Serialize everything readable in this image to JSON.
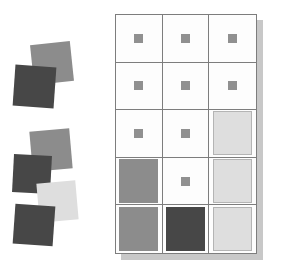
{
  "scene": {
    "title": "Square swatch sorting layout",
    "width": 283,
    "height": 275,
    "background_color": "#ffffff"
  },
  "palette": {
    "dark_gray": "#474747",
    "medium_gray": "#8c8c8c",
    "small_swatch_gray": "#909090",
    "light_gray": "#dedede",
    "swatch_outline": "#b4b4b4",
    "grid_line": "#7d7d7d",
    "panel_background": "#fdfdfd",
    "panel_shadow": "#c8c8c8"
  },
  "clusters": [
    {
      "name": "upper-cluster",
      "label": "Upper loose swatch pile",
      "left": 10,
      "top": 12,
      "width": 95,
      "height": 110,
      "squares": [
        {
          "id": "u1",
          "tone": "medium",
          "color": "#8c8c8c",
          "left": 22,
          "top": 31,
          "size": 40,
          "rotation": -6
        },
        {
          "id": "u2",
          "tone": "dark",
          "color": "#474747",
          "left": 4,
          "top": 54,
          "size": 41,
          "rotation": 4
        }
      ]
    },
    {
      "name": "lower-cluster",
      "label": "Lower loose swatch pile",
      "left": 5,
      "top": 128,
      "width": 100,
      "height": 125,
      "squares": [
        {
          "id": "l1",
          "tone": "medium",
          "color": "#8c8c8c",
          "left": 26,
          "top": 2,
          "size": 40,
          "rotation": -5
        },
        {
          "id": "l2",
          "tone": "dark",
          "color": "#474747",
          "left": 8,
          "top": 27,
          "size": 38,
          "rotation": 3
        },
        {
          "id": "l3",
          "tone": "light",
          "color": "#dedede",
          "left": 33,
          "top": 54,
          "size": 39,
          "rotation": -5
        },
        {
          "id": "l4",
          "tone": "dark",
          "color": "#474747",
          "left": 9,
          "top": 77,
          "size": 40,
          "rotation": 4
        }
      ]
    }
  ],
  "matrix": {
    "name": "swatch-grid",
    "label": "Three column by five row swatch grid",
    "left": 115,
    "top": 14,
    "width": 142,
    "height": 240,
    "shadow_offset_x": 6,
    "shadow_offset_y": 6,
    "columns": 3,
    "rows": 5,
    "cells": [
      {
        "row": 1,
        "col": 1,
        "size": "small",
        "tone": "medium",
        "color": "#909090",
        "outlined": false
      },
      {
        "row": 1,
        "col": 2,
        "size": "small",
        "tone": "medium",
        "color": "#909090",
        "outlined": false
      },
      {
        "row": 1,
        "col": 3,
        "size": "small",
        "tone": "medium",
        "color": "#909090",
        "outlined": false
      },
      {
        "row": 2,
        "col": 1,
        "size": "small",
        "tone": "medium",
        "color": "#909090",
        "outlined": false
      },
      {
        "row": 2,
        "col": 2,
        "size": "small",
        "tone": "medium",
        "color": "#909090",
        "outlined": false
      },
      {
        "row": 2,
        "col": 3,
        "size": "small",
        "tone": "medium",
        "color": "#909090",
        "outlined": false
      },
      {
        "row": 3,
        "col": 1,
        "size": "small",
        "tone": "medium",
        "color": "#909090",
        "outlined": false
      },
      {
        "row": 3,
        "col": 2,
        "size": "small",
        "tone": "medium",
        "color": "#909090",
        "outlined": false
      },
      {
        "row": 3,
        "col": 3,
        "size": "large",
        "tone": "light",
        "color": "#dedede",
        "outlined": true
      },
      {
        "row": 4,
        "col": 1,
        "size": "large",
        "tone": "medium",
        "color": "#8c8c8c",
        "outlined": false
      },
      {
        "row": 4,
        "col": 2,
        "size": "small",
        "tone": "medium",
        "color": "#909090",
        "outlined": false
      },
      {
        "row": 4,
        "col": 3,
        "size": "large",
        "tone": "light",
        "color": "#dedede",
        "outlined": true
      },
      {
        "row": 5,
        "col": 1,
        "size": "large",
        "tone": "medium",
        "color": "#8c8c8c",
        "outlined": false
      },
      {
        "row": 5,
        "col": 2,
        "size": "large",
        "tone": "dark",
        "color": "#474747",
        "outlined": false
      },
      {
        "row": 5,
        "col": 3,
        "size": "large",
        "tone": "light",
        "color": "#dedede",
        "outlined": true
      }
    ]
  }
}
